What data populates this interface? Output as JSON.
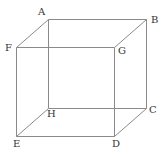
{
  "diagram": {
    "type": "cube-wireframe",
    "colors": {
      "edge": "#8a8a8a",
      "label": "#333333",
      "background": "#ffffff"
    },
    "vertices": {
      "A": {
        "x": 48,
        "y": 19,
        "lx": 38,
        "ly": 15,
        "label": "A"
      },
      "B": {
        "x": 146,
        "y": 19,
        "lx": 151,
        "ly": 23,
        "label": "B"
      },
      "F": {
        "x": 16,
        "y": 47,
        "lx": 5,
        "ly": 51,
        "label": "F"
      },
      "G": {
        "x": 114,
        "y": 47,
        "lx": 118,
        "ly": 54,
        "label": "G"
      },
      "H": {
        "x": 48,
        "y": 108,
        "lx": 47,
        "ly": 117,
        "label": "H"
      },
      "C": {
        "x": 146,
        "y": 108,
        "lx": 149,
        "ly": 113,
        "label": "C"
      },
      "E": {
        "x": 16,
        "y": 136,
        "lx": 13,
        "ly": 147,
        "label": "E"
      },
      "D": {
        "x": 114,
        "y": 136,
        "lx": 112,
        "ly": 147,
        "label": "D"
      }
    },
    "edges": [
      [
        "A",
        "B"
      ],
      [
        "A",
        "F"
      ],
      [
        "A",
        "H"
      ],
      [
        "B",
        "G"
      ],
      [
        "B",
        "C"
      ],
      [
        "F",
        "G"
      ],
      [
        "F",
        "E"
      ],
      [
        "G",
        "D"
      ],
      [
        "H",
        "C"
      ],
      [
        "H",
        "E"
      ],
      [
        "C",
        "D"
      ],
      [
        "E",
        "D"
      ]
    ]
  }
}
